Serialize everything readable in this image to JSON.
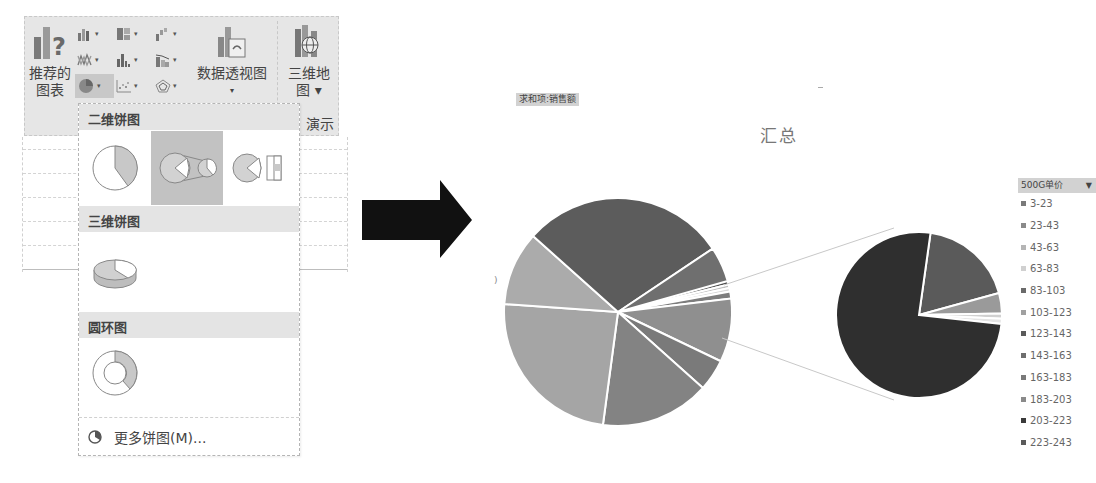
{
  "ribbon": {
    "recommended_charts": {
      "line1": "推荐的",
      "line2": "图表",
      "icon": "recommended-charts-icon"
    },
    "small_buttons": [
      {
        "icon": "column-chart-icon"
      },
      {
        "icon": "hierarchy-chart-icon"
      },
      {
        "icon": "waterfall-chart-icon"
      },
      {
        "icon": "line-chart-icon"
      },
      {
        "icon": "statistic-chart-icon"
      },
      {
        "icon": "combo-chart-icon"
      },
      {
        "icon": "pie-chart-icon",
        "active": true
      },
      {
        "icon": "scatter-chart-icon"
      },
      {
        "icon": "radar-chart-icon"
      }
    ],
    "pivot_chart": {
      "label": "数据透视图",
      "caret": "▾",
      "icon": "pivot-chart-icon"
    },
    "map_3d": {
      "line1": "三维地",
      "line2": "图 ▾",
      "icon": "3d-map-icon"
    },
    "group_label_fragment": "演示"
  },
  "dropdown": {
    "sections": [
      {
        "title": "二维饼图",
        "items": [
          "pie",
          "pie-of-pie",
          "bar-of-pie"
        ],
        "selected": 1
      },
      {
        "title": "三维饼图",
        "items": [
          "3d-pie"
        ]
      },
      {
        "title": "圆环图",
        "items": [
          "doughnut"
        ]
      }
    ],
    "more_label": "更多饼图(M)..."
  },
  "chart": {
    "field_button": "求和项:销售额",
    "title": "汇总",
    "legend_field": "500G单价",
    "legend_caret": "▼",
    "legend": [
      "3-23",
      "23-43",
      "43-63",
      "63-83",
      "83-103",
      "103-123",
      "123-143",
      "143-163",
      "163-183",
      "183-203",
      "203-223",
      "223-243"
    ]
  },
  "chart_data": {
    "type": "pie",
    "subtype": "pie-of-pie",
    "title": "汇总",
    "value_field": "求和项:销售额",
    "category_field": "500G单价",
    "categories": [
      "3-23",
      "23-43",
      "43-63",
      "63-83",
      "83-103",
      "103-123",
      "123-143",
      "143-163",
      "163-183",
      "183-203",
      "203-223",
      "223-243"
    ],
    "main_pie_slices_pct_clockwise_from_top": [
      3.5,
      11.5,
      0.5,
      0.5,
      1.0,
      9.0,
      4.5,
      15.5,
      24.0,
      10.5,
      29.0,
      5.0
    ],
    "secondary_pie_slices_pct_clockwise_from_top": [
      18.5,
      4.0,
      1.0,
      1.0,
      75.5
    ],
    "legend_position": "right"
  }
}
